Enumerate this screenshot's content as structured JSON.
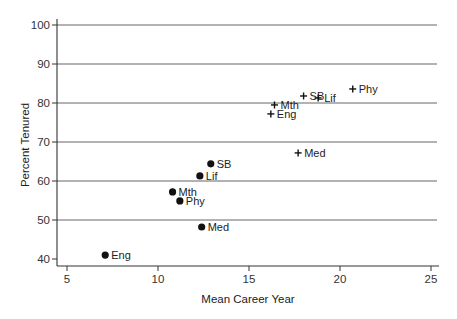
{
  "chart_data": {
    "type": "scatter",
    "title": "",
    "xlabel": "Mean Career Year",
    "ylabel": "Percent Tenured",
    "xlim": [
      5,
      25
    ],
    "ylim": [
      40,
      100
    ],
    "xticks": [
      5,
      10,
      15,
      20,
      25
    ],
    "yticks": [
      40,
      50,
      60,
      70,
      80,
      90,
      100
    ],
    "grid": "horizontal",
    "legend": "none",
    "series": [
      {
        "name": "dots",
        "marker": "filled-circle",
        "points": [
          {
            "label": "Eng",
            "x": 7.1,
            "y": 41.0
          },
          {
            "label": "Mth",
            "x": 10.8,
            "y": 57.2
          },
          {
            "label": "Phy",
            "x": 11.2,
            "y": 54.9
          },
          {
            "label": "Lif",
            "x": 12.3,
            "y": 61.3
          },
          {
            "label": "SB",
            "x": 12.9,
            "y": 64.4
          },
          {
            "label": "Med",
            "x": 12.4,
            "y": 48.2
          }
        ]
      },
      {
        "name": "crosses",
        "marker": "plus",
        "points": [
          {
            "label": "Eng",
            "x": 16.2,
            "y": 77.2
          },
          {
            "label": "Mth",
            "x": 16.4,
            "y": 79.5
          },
          {
            "label": "SB",
            "x": 18.0,
            "y": 81.8
          },
          {
            "label": "Lif",
            "x": 18.8,
            "y": 81.3
          },
          {
            "label": "Phy",
            "x": 20.7,
            "y": 83.6
          },
          {
            "label": "Med",
            "x": 17.7,
            "y": 67.2
          }
        ]
      }
    ]
  },
  "colors": {
    "axis": "#333333",
    "grid": "#555555",
    "marker": "#111111"
  }
}
